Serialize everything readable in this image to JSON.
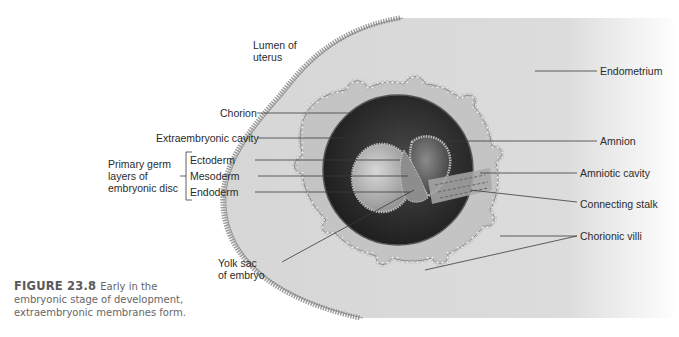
{
  "figure": {
    "number": "FIGURE 23.8",
    "caption_line1": "Early in the",
    "caption_line2": "embryonic stage of development,",
    "caption_line3": "extraembryonic membranes form."
  },
  "labels": {
    "lumen_line1": "Lumen of",
    "lumen_line2": "uterus",
    "endometrium": "Endometrium",
    "chorion": "Chorion",
    "extraembryonic_cavity": "Extraembryonic cavity",
    "amnion": "Amnion",
    "germ_group_line1": "Primary germ",
    "germ_group_line2": "layers of",
    "germ_group_line3": "embryonic disc",
    "ectoderm": "Ectoderm",
    "mesoderm": "Mesoderm",
    "endoderm": "Endoderm",
    "amniotic_cavity": "Amniotic cavity",
    "connecting_stalk": "Connecting stalk",
    "chorionic_villi": "Chorionic villi",
    "yolk_sac_line1": "Yolk sac",
    "yolk_sac_line2": "of embryo"
  },
  "colors": {
    "endometrium": "#d9d9d9",
    "chorion_membrane": "#bdbdbd",
    "cavity_dark": "#2a2a2a",
    "leader_line": "#3a3a3a",
    "text": "#2b2b2b",
    "caption": "#666666"
  }
}
